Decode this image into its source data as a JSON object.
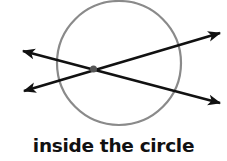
{
  "caption": "inside the circle",
  "colors": {
    "circle": "#8a8a8a",
    "lines": "#111111",
    "intersection_point": "#555555",
    "background": "#ffffff"
  },
  "diagram": {
    "circle": {
      "cx": 119,
      "cy": 63,
      "r": 62
    },
    "lines": [
      {
        "name": "line-1",
        "x1": 23,
        "y1": 51,
        "x2": 220,
        "y2": 103
      },
      {
        "name": "line-2",
        "x1": 24,
        "y1": 91,
        "x2": 220,
        "y2": 33
      }
    ],
    "intersection": {
      "cx": 93.5,
      "cy": 69
    }
  }
}
